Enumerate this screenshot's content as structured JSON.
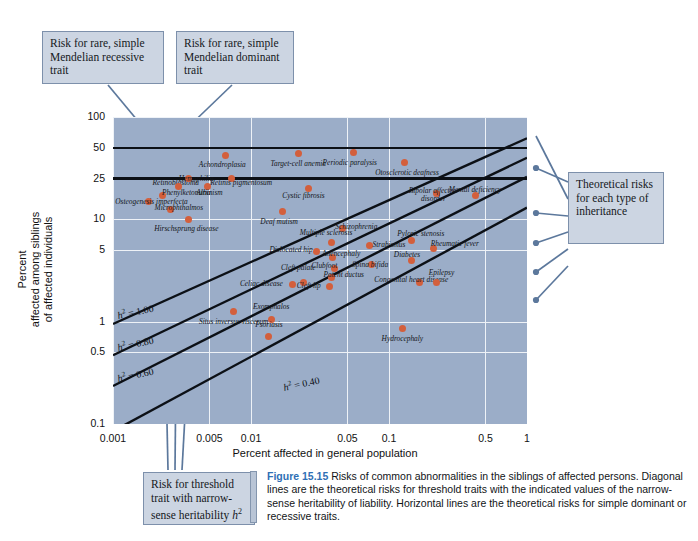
{
  "figure": {
    "label": "Figure 15.15",
    "caption": "Risks of common abnormalities in the siblings of affected persons. Diagonal lines are the theoretical risks for threshold traits with the indicated values of the narrow-sense heritability of liability. Horizontal lines are the theoretical risks for simple dominant or recessive traits."
  },
  "callouts": {
    "recessive": "Risk for rare, simple Mendelian recessive trait",
    "dominant": "Risk for rare, simple Mendelian dominant trait",
    "theoretical": "Theoretical risks for each type of inheritance",
    "threshold_a": "Risk for threshold trait with narrow-",
    "threshold_b": "sense heritability ",
    "threshold_sym": "h",
    "threshold_sup": "2"
  },
  "colors": {
    "plot_background": "#9badc8",
    "point": "#d35f3c",
    "gridline": "#eef2f7",
    "line": "#0c1016",
    "callout_fill": "#ccd5e2",
    "callout_border": "#7d90ab",
    "leader": "#5c789c",
    "caption_accent": "#2f6fb5"
  },
  "chart_data": {
    "type": "scatter",
    "title": "Risks of common abnormalities in the siblings of affected persons",
    "xlabel": "Percent affected in general population",
    "ylabel": "Percent affected among siblings of affected individuals",
    "xscale": "log",
    "yscale": "log",
    "xlim": [
      0.001,
      1
    ],
    "ylim": [
      0.1,
      100
    ],
    "grid": true,
    "legend": "none",
    "xticks": [
      "0.001",
      "0.005",
      "0.01",
      "0.05",
      "0.1",
      "0.5",
      "1"
    ],
    "xtick_values": [
      0.001,
      0.005,
      0.01,
      0.05,
      0.1,
      0.5,
      1
    ],
    "yticks": [
      "100",
      "50",
      "25",
      "10",
      "5",
      "1",
      "0.5",
      "0.1"
    ],
    "ytick_values": [
      100,
      50,
      25,
      10,
      5,
      1,
      0.5,
      0.1
    ],
    "horizontal_lines": [
      {
        "label": "dominant trait risk",
        "y": 50
      },
      {
        "label": "recessive trait risk",
        "y": 25
      }
    ],
    "diagonal_lines": [
      {
        "label": "h2 = 1.00",
        "text": "h",
        "sup": "2",
        "value": "= 1.00"
      },
      {
        "label": "h2 = 0.80",
        "text": "h",
        "sup": "2",
        "value": "= 0.80"
      },
      {
        "label": "h2 = 0.60",
        "text": "h",
        "sup": "2",
        "value": "= 0.60"
      },
      {
        "label": "h2 = 0.40",
        "text": "h",
        "sup": "2",
        "value": "= 0.40"
      }
    ],
    "points": [
      {
        "name": "Achondroplasia",
        "x": 0.0065,
        "y": 42,
        "lx": 0.0062,
        "ly": 33,
        "align": "ctr"
      },
      {
        "name": "Target-cell anemia",
        "x": 0.022,
        "y": 44,
        "lx": 0.022,
        "ly": 34,
        "align": "ctr"
      },
      {
        "name": "Periodic paralysis",
        "x": 0.055,
        "y": 45,
        "lx": 0.052,
        "ly": 35,
        "align": "ctr"
      },
      {
        "name": "Otosclerotic deafness",
        "x": 0.13,
        "y": 36,
        "lx": 0.135,
        "ly": 28,
        "align": "ctr"
      },
      {
        "name": "Retinoblastoma",
        "x": 0.0023,
        "y": 17,
        "lx": 0.0042,
        "ly": 22,
        "align": "rt"
      },
      {
        "name": "Hemophilia",
        "x": 0.0035,
        "y": 25,
        "lx": 0.004,
        "ly": 24,
        "align": "ctr"
      },
      {
        "name": "Albinism",
        "x": 0.0048,
        "y": 21,
        "lx": 0.005,
        "ly": 17.5,
        "align": "ctr"
      },
      {
        "name": "Phenylketonuria",
        "x": 0.003,
        "y": 21,
        "lx": 0.0034,
        "ly": 17.5,
        "align": "ctr"
      },
      {
        "name": "Osteogenesis imperfecta",
        "x": 0.0018,
        "y": 15,
        "lx": 0.0019,
        "ly": 14.5,
        "align": "ctr"
      },
      {
        "name": "Microphthalmos",
        "x": 0.0026,
        "y": 12.5,
        "lx": 0.003,
        "ly": 12.5,
        "align": "ctr"
      },
      {
        "name": "Hirschsprung disease",
        "x": 0.0035,
        "y": 10,
        "lx": 0.0034,
        "ly": 7.8,
        "align": "ctr"
      },
      {
        "name": "Retinis pigmentosum",
        "x": 0.0072,
        "y": 25,
        "lx": 0.0085,
        "ly": 22,
        "align": "ctr"
      },
      {
        "name": "Cystic fibrosis",
        "x": 0.026,
        "y": 20,
        "lx": 0.024,
        "ly": 16.5,
        "align": "ctr"
      },
      {
        "name": "Deaf mutism",
        "x": 0.017,
        "y": 12,
        "lx": 0.016,
        "ly": 9.3,
        "align": "ctr"
      },
      {
        "name": "Schizophrenia",
        "x": 0.046,
        "y": 8.2,
        "lx": 0.058,
        "ly": 8.2,
        "align": "ctr"
      },
      {
        "name": "Bipolar affective disorder",
        "x": 0.22,
        "y": 18,
        "lx": 0.21,
        "ly": 18.5,
        "align": "ctr"
      },
      {
        "name": "Mental deficiency",
        "x": 0.42,
        "y": 17,
        "lx": 0.42,
        "ly": 19,
        "align": "ctr"
      },
      {
        "name": "Multiple sclerosis",
        "x": 0.038,
        "y": 6.0,
        "lx": 0.035,
        "ly": 7.2,
        "align": "ctr"
      },
      {
        "name": "Strabismus",
        "x": 0.072,
        "y": 5.6,
        "lx": 0.1,
        "ly": 5.5,
        "align": "ctr"
      },
      {
        "name": "Pyloric stenosis",
        "x": 0.145,
        "y": 6.2,
        "lx": 0.17,
        "ly": 7.0,
        "align": "ctr"
      },
      {
        "name": "Rheumatic fever",
        "x": 0.21,
        "y": 5.2,
        "lx": 0.3,
        "ly": 5.6,
        "align": "ctr"
      },
      {
        "name": "Dislocated hip",
        "x": 0.03,
        "y": 4.9,
        "lx": 0.028,
        "ly": 4.9,
        "align": "rt"
      },
      {
        "name": "Anencephaly",
        "x": 0.039,
        "y": 4.2,
        "lx": 0.045,
        "ly": 4.5,
        "align": "ctr"
      },
      {
        "name": "Spina bifida",
        "x": 0.075,
        "y": 3.6,
        "lx": 0.073,
        "ly": 3.5,
        "align": "ctr"
      },
      {
        "name": "Diabetes",
        "x": 0.145,
        "y": 4.0,
        "lx": 0.135,
        "ly": 4.4,
        "align": "ctr"
      },
      {
        "name": "Clubfoot",
        "x": 0.04,
        "y": 3.3,
        "lx": 0.034,
        "ly": 3.4,
        "align": "ctr"
      },
      {
        "name": "Patent ductus",
        "x": 0.038,
        "y": 2.7,
        "lx": 0.047,
        "ly": 2.8,
        "align": "ctr"
      },
      {
        "name": "Cleft palate",
        "x": 0.024,
        "y": 2.4,
        "lx": 0.022,
        "ly": 3.3,
        "align": "ctr"
      },
      {
        "name": "Celiac disease",
        "x": 0.02,
        "y": 2.3,
        "lx": 0.017,
        "ly": 2.3,
        "align": "rt"
      },
      {
        "name": "Cleft lip",
        "x": 0.037,
        "y": 2.2,
        "lx": 0.032,
        "ly": 2.2,
        "align": "rt"
      },
      {
        "name": "Congenital heart disease",
        "x": 0.165,
        "y": 2.4,
        "lx": 0.145,
        "ly": 2.5,
        "align": "ctr"
      },
      {
        "name": "Epilepsy",
        "x": 0.22,
        "y": 2.4,
        "lx": 0.24,
        "ly": 2.9,
        "align": "ctr"
      },
      {
        "name": "Situs inversus viscerum",
        "x": 0.0075,
        "y": 1.25,
        "lx": 0.0075,
        "ly": 0.98,
        "align": "ctr"
      },
      {
        "name": "Exomphalos",
        "x": 0.014,
        "y": 1.05,
        "lx": 0.014,
        "ly": 1.35,
        "align": "ctr"
      },
      {
        "name": "Psoriasis",
        "x": 0.0135,
        "y": 0.72,
        "lx": 0.0135,
        "ly": 0.9,
        "align": "ctr"
      },
      {
        "name": "Hydrocephaly",
        "x": 0.125,
        "y": 0.85,
        "lx": 0.125,
        "ly": 0.66,
        "align": "ctr"
      }
    ]
  },
  "axis": {
    "x_title": "Percent affected in general population",
    "y_title_line1": "Percent",
    "y_title_line2": "affected among siblings",
    "y_title_line3": "of affected individuals"
  }
}
